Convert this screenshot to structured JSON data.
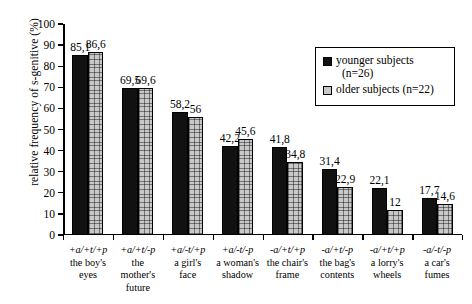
{
  "chart_data": {
    "type": "bar",
    "title": "",
    "xlabel": "",
    "ylabel": "relative frequency of s-genitive (%)",
    "ylim": [
      0,
      100
    ],
    "ytick_labels": [
      "100",
      "90",
      "80",
      "70",
      "60",
      "50",
      "40",
      "30",
      "20",
      "10",
      "0"
    ],
    "yticks": [
      100,
      90,
      80,
      70,
      60,
      50,
      40,
      30,
      20,
      10,
      0
    ],
    "grid": false,
    "legend_position": "top-right",
    "categories": [
      {
        "code": "+a/+t/+p",
        "word1": "the boy's",
        "word2": "eyes",
        "word3": ""
      },
      {
        "code": "+a/+t/-p",
        "word1": "the",
        "word2": "mother's",
        "word3": "future"
      },
      {
        "code": "+a/-t/+p",
        "word1": "a girl's",
        "word2": "face",
        "word3": ""
      },
      {
        "code": "+a/-t/-p",
        "word1": "a woman's",
        "word2": "shadow",
        "word3": ""
      },
      {
        "code": "-a/+t/+p",
        "word1": "the chair's",
        "word2": "frame",
        "word3": ""
      },
      {
        "code": "-a/+t/-p",
        "word1": "the bag's",
        "word2": "contents",
        "word3": ""
      },
      {
        "code": "-a/+t/+p",
        "word1": "a lorry's",
        "word2": "wheels",
        "word3": ""
      },
      {
        "code": "-a/-t/-p",
        "word1": "a car's",
        "word2": "fumes",
        "word3": ""
      }
    ],
    "series": [
      {
        "name": "younger subjects (n=26)",
        "legend_line1": "younger subjects",
        "legend_line2": "(n=26)",
        "color": "#111111",
        "values": [
          85.1,
          69.5,
          58.2,
          42.2,
          41.8,
          31.4,
          22.1,
          17.7
        ],
        "value_labels": [
          "85,1",
          "69,5",
          "58,2",
          "42,2",
          "41,8",
          "31,4",
          "22,1",
          "17,7"
        ]
      },
      {
        "name": "older subjects (n=22)",
        "legend_line1": "older subjects (n=22)",
        "legend_line2": "",
        "color": "#c8c8c8",
        "values": [
          86.6,
          69.6,
          56,
          45.6,
          34.8,
          22.9,
          12,
          14.6
        ],
        "value_labels": [
          "86,6",
          "69,6",
          "56",
          "45,6",
          "34,8",
          "22,9",
          "12",
          "14,6"
        ]
      }
    ]
  }
}
